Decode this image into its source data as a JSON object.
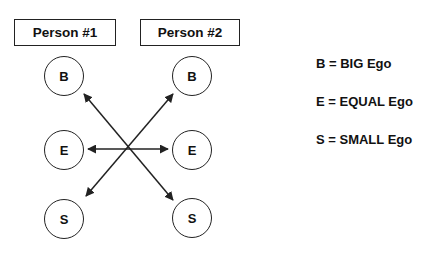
{
  "persons": [
    {
      "label": "Person #1"
    },
    {
      "label": "Person #2"
    }
  ],
  "nodes": {
    "person1": [
      "B",
      "E",
      "S"
    ],
    "person2": [
      "B",
      "E",
      "S"
    ]
  },
  "legend": [
    {
      "text": "B = BIG Ego"
    },
    {
      "text": "E = EQUAL Ego"
    },
    {
      "text": "S = SMALL Ego"
    }
  ],
  "arrows": [
    {
      "from": "person2.S",
      "to": "person1.B",
      "style": "double-headed"
    },
    {
      "from": "person1.S",
      "to": "person2.B",
      "style": "double-headed"
    },
    {
      "from": "person1.E",
      "to": "person2.E",
      "style": "double-headed"
    }
  ],
  "colors": {
    "stroke": "#222222",
    "background": "#ffffff",
    "text": "#111111"
  }
}
